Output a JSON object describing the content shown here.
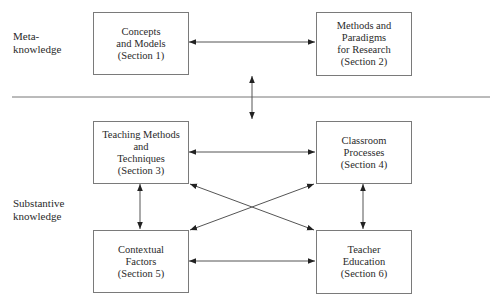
{
  "side_labels": {
    "meta": [
      "Meta-",
      "knowledge"
    ],
    "substantive": [
      "Substantive",
      "knowledge"
    ]
  },
  "boxes": [
    {
      "id": "concepts-models",
      "lines": [
        "Concepts",
        "and Models",
        "(Section 1)"
      ]
    },
    {
      "id": "methods-paradigms",
      "lines": [
        "Methods and",
        "Paradigms",
        "for Research",
        "(Section 2)"
      ]
    },
    {
      "id": "teaching-methods",
      "lines": [
        "Teaching Methods",
        "and",
        "Techniques",
        "(Section 3)"
      ]
    },
    {
      "id": "classroom-processes",
      "lines": [
        "Classroom",
        "Processes",
        "(Section 4)"
      ]
    },
    {
      "id": "contextual-factors",
      "lines": [
        "Contextual",
        "Factors",
        "(Section 5)"
      ]
    },
    {
      "id": "teacher-education",
      "lines": [
        "Teacher",
        "Education",
        "(Section 6)"
      ]
    }
  ],
  "connections": [
    {
      "from": "concepts-models",
      "to": "methods-paradigms",
      "type": "bidirectional"
    },
    {
      "from": "meta-knowledge",
      "to": "substantive-knowledge",
      "type": "bidirectional"
    },
    {
      "from": "teaching-methods",
      "to": "classroom-processes",
      "type": "bidirectional"
    },
    {
      "from": "teaching-methods",
      "to": "contextual-factors",
      "type": "bidirectional"
    },
    {
      "from": "teaching-methods",
      "to": "teacher-education",
      "type": "bidirectional"
    },
    {
      "from": "classroom-processes",
      "to": "teacher-education",
      "type": "bidirectional"
    },
    {
      "from": "classroom-processes",
      "to": "contextual-factors",
      "type": "bidirectional"
    },
    {
      "from": "contextual-factors",
      "to": "teacher-education",
      "type": "bidirectional"
    }
  ],
  "colors": {
    "line": "#555555",
    "box_border": "#7a7a7a",
    "text": "#2a2a2a"
  }
}
